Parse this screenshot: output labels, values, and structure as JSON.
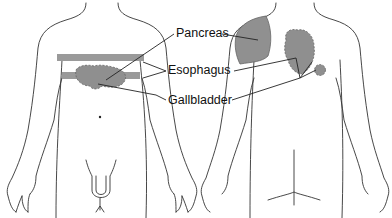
{
  "diagram": {
    "type": "referred-pain-body-map",
    "views": [
      "anterior",
      "posterior"
    ],
    "labels": [
      {
        "id": "pancreas",
        "text": "Pancreas"
      },
      {
        "id": "esophagus",
        "text": "Esophagus"
      },
      {
        "id": "gallbladder",
        "text": "Gallbladder"
      }
    ],
    "colors": {
      "region_fill": "#8f8f8f",
      "band_fill": "#9a9a9a",
      "outline": "#333333",
      "background": "#ffffff"
    }
  }
}
